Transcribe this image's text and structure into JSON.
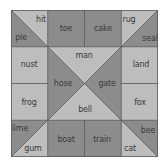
{
  "colors": {
    "light": "#bdbdbd",
    "dark": "#8c8c8c",
    "line": "#5a5a5a",
    "text": "#3a3a3a"
  },
  "grid": {
    "rows": 4,
    "cols": 4
  },
  "words": [
    {
      "id": "hit",
      "text": "hit",
      "x": 30,
      "y": 9,
      "shade": "light"
    },
    {
      "id": "pie",
      "text": "pie",
      "x": 10,
      "y": 27,
      "shade": "dark"
    },
    {
      "id": "toe",
      "text": "toe",
      "x": 55,
      "y": 18,
      "shade": "dark"
    },
    {
      "id": "cake",
      "text": "cake",
      "x": 92,
      "y": 18,
      "shade": "dark"
    },
    {
      "id": "rug",
      "text": "rug",
      "x": 118,
      "y": 9,
      "shade": "light"
    },
    {
      "id": "seal",
      "text": "seal",
      "x": 139,
      "y": 28,
      "shade": "dark"
    },
    {
      "id": "nust",
      "text": "nust",
      "x": 18,
      "y": 54,
      "shade": "light"
    },
    {
      "id": "man",
      "text": "man",
      "x": 73,
      "y": 45,
      "shade": "light"
    },
    {
      "id": "land",
      "text": "land",
      "x": 130,
      "y": 54,
      "shade": "light"
    },
    {
      "id": "hose",
      "text": "hose",
      "x": 52,
      "y": 73,
      "shade": "dark"
    },
    {
      "id": "gate",
      "text": "gate",
      "x": 96,
      "y": 73,
      "shade": "dark"
    },
    {
      "id": "frog",
      "text": "frog",
      "x": 18,
      "y": 92,
      "shade": "light"
    },
    {
      "id": "bell",
      "text": "bell",
      "x": 74,
      "y": 99,
      "shade": "light"
    },
    {
      "id": "fox",
      "text": "fox",
      "x": 129,
      "y": 92,
      "shade": "light"
    },
    {
      "id": "lime",
      "text": "lime",
      "x": 9,
      "y": 118,
      "shade": "dark"
    },
    {
      "id": "gum",
      "text": "gum",
      "x": 22,
      "y": 138,
      "shade": "light"
    },
    {
      "id": "boat",
      "text": "boat",
      "x": 55,
      "y": 129,
      "shade": "dark"
    },
    {
      "id": "train",
      "text": "train",
      "x": 91,
      "y": 129,
      "shade": "dark"
    },
    {
      "id": "bee",
      "text": "bee",
      "x": 137,
      "y": 120,
      "shade": "dark"
    },
    {
      "id": "cat",
      "text": "cat",
      "x": 119,
      "y": 138,
      "shade": "light"
    }
  ]
}
